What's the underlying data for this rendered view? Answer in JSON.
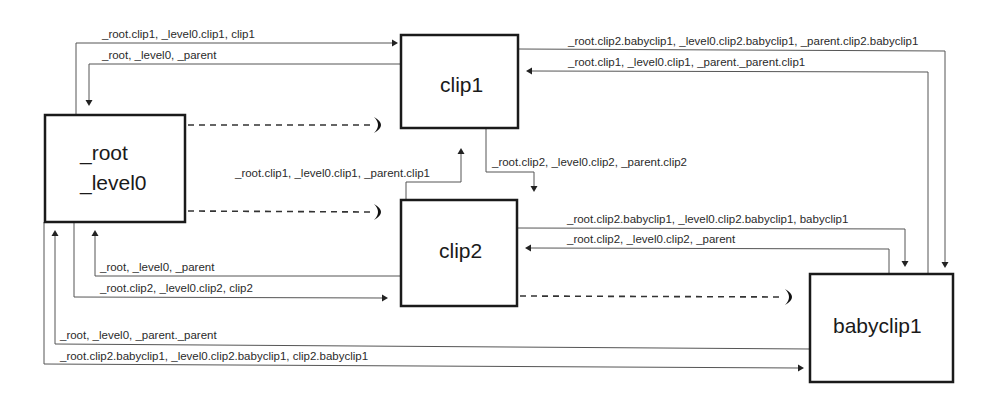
{
  "diagram": {
    "nodes": {
      "root": {
        "line1": "_root",
        "line2": "_level0"
      },
      "clip1": {
        "label": "clip1"
      },
      "clip2": {
        "label": "clip2"
      },
      "babyclip1": {
        "label": "babyclip1"
      }
    },
    "edges": {
      "root_to_clip1": "_root.clip1, _level0.clip1, clip1",
      "clip1_to_root": "_root, _level0, _parent",
      "clip1_to_babyclip1": "_root.clip2.babyclip1, _level0.clip2.babyclip1, _parent.clip2.babyclip1",
      "babyclip1_to_clip1": "_root.clip1, _level0.clip1, _parent._parent.clip1",
      "clip2_to_clip1": "_root.clip1, _level0.clip1, _parent.clip1",
      "clip1_to_clip2": "_root.clip2, _level0.clip2, _parent.clip2",
      "clip2_to_babyclip1": "_root.clip2.babyclip1, _level0.clip2.babyclip1, babyclip1",
      "babyclip1_to_clip2": "_root.clip2, _level0.clip2, _parent",
      "clip2_to_root": "_root, _level0, _parent",
      "root_to_clip2": "_root.clip2, _level0.clip2, clip2",
      "babyclip1_to_root": "_root, _level0, _parent._parent",
      "root_to_babyclip1": "_root.clip2.babyclip1, _level0.clip2.babyclip1, clip2.babyclip1"
    }
  }
}
